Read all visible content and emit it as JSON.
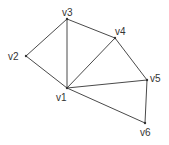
{
  "diagram": {
    "type": "graph",
    "style": {
      "edge_color": "#4a4a4a",
      "vertex_color": "#333333",
      "label_color": "#333333",
      "background": "#ffffff"
    },
    "vertices": [
      {
        "id": "v1",
        "label": "v1",
        "x": 67,
        "y": 88,
        "lx": 56,
        "ly": 101
      },
      {
        "id": "v2",
        "label": "v2",
        "x": 26,
        "y": 56,
        "lx": 8,
        "ly": 60
      },
      {
        "id": "v3",
        "label": "v3",
        "x": 67,
        "y": 19,
        "lx": 62,
        "ly": 16
      },
      {
        "id": "v4",
        "label": "v4",
        "x": 115,
        "y": 38,
        "lx": 115,
        "ly": 35
      },
      {
        "id": "v5",
        "label": "v5",
        "x": 147,
        "y": 80,
        "lx": 150,
        "ly": 82
      },
      {
        "id": "v6",
        "label": "v6",
        "x": 145,
        "y": 123,
        "lx": 140,
        "ly": 136
      }
    ],
    "edges": [
      {
        "from": "v1",
        "to": "v2"
      },
      {
        "from": "v1",
        "to": "v3"
      },
      {
        "from": "v1",
        "to": "v4"
      },
      {
        "from": "v1",
        "to": "v5"
      },
      {
        "from": "v1",
        "to": "v6"
      },
      {
        "from": "v2",
        "to": "v3"
      },
      {
        "from": "v3",
        "to": "v4"
      },
      {
        "from": "v4",
        "to": "v5"
      },
      {
        "from": "v5",
        "to": "v6"
      }
    ]
  }
}
